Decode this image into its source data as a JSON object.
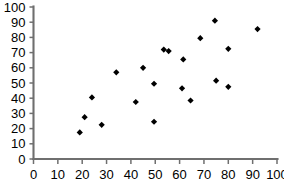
{
  "chart_data": {
    "type": "scatter",
    "title": "",
    "subtitle": "",
    "xlabel": "",
    "ylabel": "",
    "xlim": [
      0,
      100
    ],
    "ylim": [
      0,
      100
    ],
    "xticks": [
      0,
      10,
      20,
      30,
      40,
      50,
      60,
      70,
      80,
      90,
      100
    ],
    "yticks": [
      0,
      10,
      20,
      30,
      40,
      50,
      60,
      70,
      80,
      90,
      100
    ],
    "xtick_labels": [
      "0",
      "10",
      "20",
      "30",
      "40",
      "50",
      "60",
      "70",
      "80",
      "90",
      "100"
    ],
    "ytick_labels": [
      "0",
      "10",
      "20",
      "30",
      "40",
      "50",
      "60",
      "70",
      "80",
      "90",
      "100"
    ],
    "grid": false,
    "legend": null,
    "legend_position": "none",
    "marker": "diamond",
    "marker_color": "#000000",
    "axis_color": "#6f6f6f",
    "background_color": "#ffffff",
    "series": [
      {
        "name": "",
        "points": [
          {
            "x": 19,
            "y": 17.5
          },
          {
            "x": 21,
            "y": 27.5
          },
          {
            "x": 24,
            "y": 40.5
          },
          {
            "x": 28,
            "y": 22.5
          },
          {
            "x": 34,
            "y": 57
          },
          {
            "x": 42,
            "y": 37.5
          },
          {
            "x": 45,
            "y": 60
          },
          {
            "x": 49.5,
            "y": 24.5
          },
          {
            "x": 49.5,
            "y": 49.5
          },
          {
            "x": 53.5,
            "y": 72
          },
          {
            "x": 55.5,
            "y": 71
          },
          {
            "x": 61,
            "y": 46.5
          },
          {
            "x": 61.5,
            "y": 65.5
          },
          {
            "x": 64.5,
            "y": 38.5
          },
          {
            "x": 68.5,
            "y": 79.5
          },
          {
            "x": 74.5,
            "y": 91
          },
          {
            "x": 75,
            "y": 51.5
          },
          {
            "x": 80,
            "y": 47.5
          },
          {
            "x": 80,
            "y": 72.5
          },
          {
            "x": 92,
            "y": 85.5
          }
        ]
      }
    ]
  },
  "caption": {
    "cropped_text": ""
  }
}
